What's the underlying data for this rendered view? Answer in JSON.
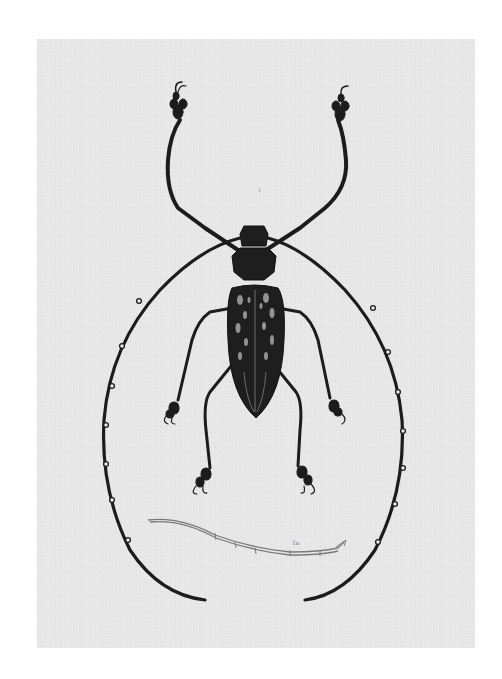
{
  "plate": {
    "subject": "longhorn beetle illustration",
    "background_color": "#e9e9e9",
    "ink_color": "#1c1c1c",
    "figure_labels": {
      "main_mark": "1",
      "antenna_detail": "1a"
    }
  }
}
